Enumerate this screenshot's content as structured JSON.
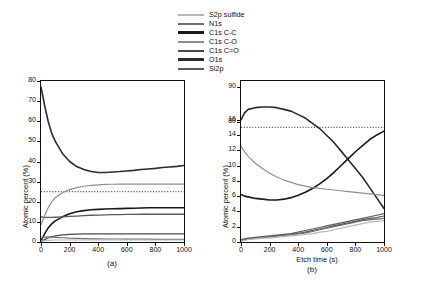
{
  "legend": {
    "items": [
      {
        "label": "S2p sulfide",
        "color": "#b8b8b8"
      },
      {
        "label": "N1s",
        "color": "#6f6f6f"
      },
      {
        "label": "C1s C-C",
        "color": "#1a1a1a"
      },
      {
        "label": "C1s C-O",
        "color": "#8f8f8f"
      },
      {
        "label": "C1s C=O",
        "color": "#4a4a4a"
      },
      {
        "label": "O1s",
        "color": "#2b2b2b"
      },
      {
        "label": "Si2p",
        "color": "#5a5a5a"
      }
    ]
  },
  "chart_data": [
    {
      "type": "line",
      "title": "(a)",
      "xlabel": "",
      "ylabel": "Atomic percent (%)",
      "xlim": [
        0,
        1000
      ],
      "ylim": [
        0,
        80
      ],
      "xticks": [
        0,
        200,
        400,
        600,
        800,
        1000
      ],
      "yticks": [
        0,
        10,
        20,
        30,
        40,
        50,
        60,
        70,
        80
      ],
      "grid": false,
      "reference_line": {
        "y": 25,
        "style": "dotted"
      },
      "x": [
        0,
        25,
        50,
        75,
        100,
        150,
        200,
        250,
        300,
        350,
        400,
        450,
        500,
        550,
        600,
        650,
        700,
        750,
        800,
        850,
        900,
        950,
        1000
      ],
      "series": [
        {
          "name": "O1s",
          "color": "#2b2b2b",
          "width": 1.6,
          "values": [
            77,
            68,
            60,
            54,
            50,
            44,
            40,
            37.5,
            36,
            35,
            34.5,
            34.5,
            34.8,
            35,
            35.3,
            35.6,
            36,
            36.3,
            36.6,
            37,
            37.3,
            37.6,
            38
          ]
        },
        {
          "name": "C1s C-C",
          "color": "#1a1a1a",
          "width": 1.6,
          "values": [
            0.5,
            4,
            7,
            9,
            10.5,
            12.5,
            14,
            15,
            15.6,
            16,
            16.2,
            16.4,
            16.5,
            16.6,
            16.7,
            16.8,
            16.9,
            17,
            17,
            17,
            17,
            17,
            17
          ]
        },
        {
          "name": "Si2p",
          "color": "#5a5a5a",
          "width": 1.3,
          "values": [
            12.5,
            12.3,
            12.2,
            12.2,
            12.3,
            12.5,
            12.7,
            12.9,
            13.1,
            13.3,
            13.4,
            13.5,
            13.6,
            13.6,
            13.7,
            13.7,
            13.8,
            13.8,
            13.8,
            13.8,
            13.8,
            13.8,
            13.8
          ]
        },
        {
          "name": "C1s C-O",
          "color": "#8f8f8f",
          "width": 1.2,
          "values": [
            8.5,
            13,
            17,
            20,
            22,
            24.5,
            26,
            27,
            27.7,
            28.1,
            28.4,
            28.6,
            28.7,
            28.8,
            28.8,
            28.8,
            28.8,
            28.8,
            28.8,
            28.8,
            28.8,
            28.8,
            28.8
          ]
        },
        {
          "name": "C1s C=O",
          "color": "#4a4a4a",
          "width": 1.2,
          "values": [
            0.3,
            1.2,
            2.0,
            2.6,
            3.0,
            3.5,
            3.8,
            3.9,
            4.0,
            4.0,
            4.0,
            4.0,
            4.0,
            4.0,
            4.0,
            4.0,
            4.0,
            4.0,
            4.0,
            4.0,
            4.0,
            4.0,
            4.0
          ]
        },
        {
          "name": "N1s",
          "color": "#6f6f6f",
          "width": 1.2,
          "values": [
            2.0,
            2.4,
            2.5,
            2.4,
            2.3,
            2.1,
            1.9,
            1.8,
            1.7,
            1.6,
            1.6,
            1.5,
            1.5,
            1.5,
            1.4,
            1.4,
            1.4,
            1.4,
            1.3,
            1.3,
            1.3,
            1.3,
            1.3
          ]
        },
        {
          "name": "S2p sulfide",
          "color": "#b8b8b8",
          "width": 1.2,
          "values": [
            0.4,
            0.6,
            0.8,
            0.9,
            1.0,
            1.0,
            1.0,
            1.0,
            1.0,
            1.0,
            1.0,
            1.0,
            1.0,
            1.0,
            1.0,
            1.0,
            1.0,
            1.0,
            1.0,
            1.0,
            1.0,
            1.0,
            1.0
          ]
        }
      ]
    },
    {
      "type": "line",
      "title": "(b)",
      "xlabel": "Etch time (s)",
      "ylabel": "Atomic percent (%)",
      "xlim": [
        0,
        1000
      ],
      "ylim": [
        0,
        90
      ],
      "xticks": [
        0,
        200,
        400,
        600,
        800,
        1000
      ],
      "yticks": [
        0,
        2,
        4,
        6,
        8,
        10,
        12,
        14,
        16,
        80,
        90
      ],
      "grid": false,
      "reference_line": {
        "y": 15,
        "style": "dotted"
      },
      "x": [
        0,
        25,
        50,
        100,
        150,
        200,
        250,
        300,
        350,
        400,
        450,
        500,
        550,
        600,
        650,
        700,
        750,
        800,
        850,
        900,
        950,
        1000
      ],
      "series": [
        {
          "name": "O1s",
          "color": "#2b2b2b",
          "width": 1.6,
          "values": [
            80.5,
            82.5,
            83.5,
            84,
            84.2,
            84.2,
            84,
            83.5,
            83,
            82,
            81,
            79.5,
            78,
            76,
            74,
            71.5,
            69,
            66.5,
            64,
            61,
            58,
            55
          ]
        },
        {
          "name": "C1s C-C",
          "color": "#1a1a1a",
          "width": 1.6,
          "values": [
            6.2,
            6.0,
            5.9,
            5.7,
            5.6,
            5.5,
            5.5,
            5.6,
            5.8,
            6.1,
            6.5,
            7.0,
            7.6,
            8.3,
            9.1,
            10.0,
            10.9,
            11.8,
            12.6,
            13.4,
            14.0,
            14.5
          ]
        },
        {
          "name": "C1s C-O",
          "color": "#8f8f8f",
          "width": 1.2,
          "values": [
            12.5,
            11.8,
            11.2,
            10.3,
            9.6,
            9.0,
            8.5,
            8.1,
            7.8,
            7.5,
            7.3,
            7.1,
            7.0,
            6.9,
            6.8,
            6.7,
            6.6,
            6.5,
            6.4,
            6.3,
            6.2,
            6.1
          ]
        },
        {
          "name": "Si2p",
          "color": "#5a5a5a",
          "width": 1.2,
          "values": [
            0.3,
            0.4,
            0.5,
            0.6,
            0.7,
            0.8,
            0.9,
            1.0,
            1.1,
            1.3,
            1.5,
            1.7,
            1.9,
            2.1,
            2.3,
            2.5,
            2.7,
            2.9,
            3.1,
            3.3,
            3.5,
            3.7
          ]
        },
        {
          "name": "C1s C=O",
          "color": "#4a4a4a",
          "width": 1.2,
          "values": [
            0.2,
            0.3,
            0.4,
            0.5,
            0.6,
            0.7,
            0.8,
            0.9,
            1.0,
            1.1,
            1.3,
            1.5,
            1.7,
            1.9,
            2.1,
            2.3,
            2.5,
            2.7,
            2.9,
            3.1,
            3.2,
            3.4
          ]
        },
        {
          "name": "N1s",
          "color": "#6f6f6f",
          "width": 1.2,
          "values": [
            0.2,
            0.3,
            0.4,
            0.5,
            0.6,
            0.7,
            0.8,
            0.9,
            1.0,
            1.1,
            1.2,
            1.4,
            1.6,
            1.8,
            2.0,
            2.2,
            2.4,
            2.6,
            2.8,
            2.9,
            3.0,
            3.1
          ]
        },
        {
          "name": "S2p sulfide",
          "color": "#b8b8b8",
          "width": 1.2,
          "values": [
            0.1,
            0.2,
            0.3,
            0.4,
            0.5,
            0.5,
            0.6,
            0.7,
            0.8,
            0.9,
            1.0,
            1.1,
            1.3,
            1.4,
            1.6,
            1.8,
            2.0,
            2.2,
            2.4,
            2.6,
            2.7,
            2.8
          ]
        }
      ]
    }
  ]
}
